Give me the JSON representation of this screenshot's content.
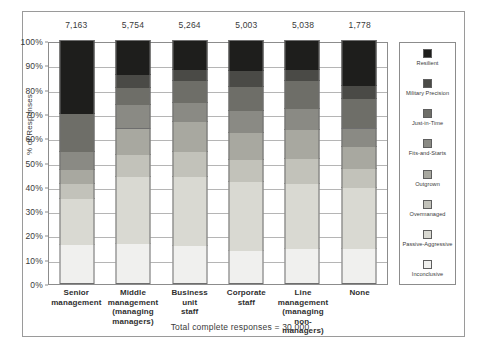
{
  "chart_data": {
    "type": "bar",
    "subtype": "100% stacked column",
    "title": "",
    "xlabel": "",
    "ylabel": "% of Responses",
    "ylim": [
      0,
      100
    ],
    "grid": true,
    "legend_position": "right",
    "categories": [
      "Senior\nmanagement",
      "Middle\nmanagement\n(managing\nmanagers)",
      "Business\nunit\nstaff",
      "Corporate\nstaff",
      "Line\nmanagement\n(managing\nnon-managers)",
      "None"
    ],
    "category_lines": [
      [
        "Senior",
        "management"
      ],
      [
        "Middle",
        "management",
        "(managing",
        "managers)"
      ],
      [
        "Business",
        "unit",
        "staff"
      ],
      [
        "Corporate",
        "staff"
      ],
      [
        "Line",
        "management",
        "(managing",
        "non-managers)"
      ],
      [
        "None"
      ]
    ],
    "column_totals": [
      "7,163",
      "5,754",
      "5,264",
      "5,003",
      "5,038",
      "1,778"
    ],
    "ytick_labels": [
      "0%",
      "10%",
      "20%",
      "30%",
      "40%",
      "50%",
      "60%",
      "70%",
      "80%",
      "90%",
      "100%"
    ],
    "ytick_values": [
      0,
      10,
      20,
      30,
      40,
      50,
      60,
      70,
      80,
      90,
      100
    ],
    "series": [
      {
        "name": "Inconclusive",
        "color": "#f0f0ee",
        "values": [
          16.0,
          16.5,
          15.5,
          13.5,
          14.5,
          14.5
        ]
      },
      {
        "name": "Passive-Aggressive",
        "color": "#d9d9d2",
        "values": [
          19.0,
          27.5,
          28.5,
          28.5,
          26.5,
          25.0
        ]
      },
      {
        "name": "Overmanaged",
        "color": "#c2c2ba",
        "values": [
          6.0,
          9.0,
          10.5,
          9.0,
          10.5,
          8.0
        ]
      },
      {
        "name": "Outgrown",
        "color": "#a8a8a0",
        "values": [
          6.0,
          11.0,
          12.0,
          11.0,
          12.0,
          9.0
        ]
      },
      {
        "name": "Fits-and-Starts",
        "color": "#8a8a84",
        "values": [
          7.5,
          9.5,
          8.0,
          9.0,
          8.5,
          7.5
        ]
      },
      {
        "name": "Just-in-Time",
        "color": "#6e6e68",
        "values": [
          15.5,
          7.0,
          9.0,
          10.0,
          11.5,
          12.0
        ]
      },
      {
        "name": "Military Precision",
        "color": "#4a4a46",
        "values": [
          0.0,
          5.5,
          4.5,
          6.5,
          4.5,
          5.5
        ]
      },
      {
        "name": "Resilient",
        "color": "#1e1e1c",
        "values": [
          30.0,
          14.0,
          12.0,
          12.5,
          12.0,
          18.5
        ]
      }
    ],
    "footnote": "Total complete responses = 30,000"
  },
  "legend": {
    "items": [
      {
        "label": "Resilient",
        "color": "#1e1e1c"
      },
      {
        "label": "Military Precision",
        "color": "#4a4a46"
      },
      {
        "label": "Just-in-Time",
        "color": "#6e6e68"
      },
      {
        "label": "Fits-and-Starts",
        "color": "#8a8a84"
      },
      {
        "label": "Outgrown",
        "color": "#a8a8a0"
      },
      {
        "label": "Overmanaged",
        "color": "#c2c2ba"
      },
      {
        "label": "Passive-Aggressive",
        "color": "#d9d9d2"
      },
      {
        "label": "Inconclusive",
        "color": "#f0f0ee"
      }
    ]
  },
  "colors": {
    "frame": "#9a9a9a",
    "axis": "#8c8c8c",
    "gridline": "#b5b5b5",
    "text": "#3a3a3a",
    "background": "#ffffff"
  }
}
